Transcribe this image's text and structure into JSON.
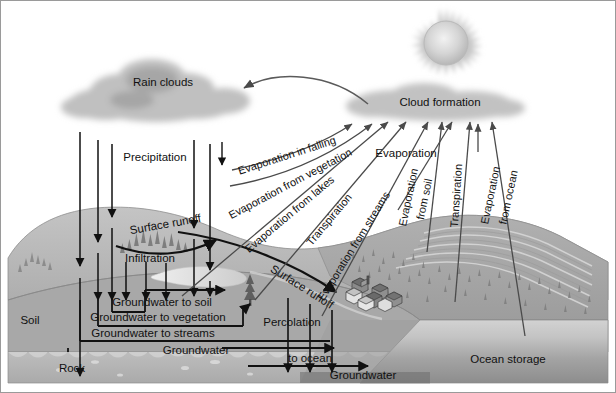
{
  "diagram": {
    "width": 616,
    "height": 393
  },
  "sky": {
    "sun": "sun-icon",
    "rain_clouds_label": "Rain clouds",
    "cloud_formation_label": "Cloud formation"
  },
  "labels": {
    "precipitation": "Precipitation",
    "evaporation_in_falling": "Evaporation in falling",
    "evaporation_from_vegetation": "Evaporation from vegetation",
    "evaporation_from_lakes": "Evaporation from lakes",
    "transpiration_left": "Transpiration",
    "evaporation_from_streams": "Evaporation from streams",
    "evaporation": "Evaporation",
    "evaporation_from_soil_1": "Evaporation",
    "evaporation_from_soil_2": "from soil",
    "transpiration_right": "Transpiration",
    "evaporation_from_ocean_1": "Evaporation",
    "evaporation_from_ocean_2": "from ocean",
    "surface_runoff_upper": "Surface runoff",
    "surface_runoff_lower": "Surface runoff",
    "infiltration": "Infiltration",
    "percolation": "Percolation",
    "groundwater_to_soil": "Groundwater to soil",
    "groundwater_to_vegetation": "Groundwater to vegetation",
    "groundwater_to_streams": "Groundwater to streams",
    "groundwater_mid": "Groundwater",
    "to_ocean": "to ocean",
    "groundwater_bottom": "Groundwater",
    "soil": "Soil",
    "rock": "Rock",
    "ocean_storage": "Ocean storage"
  },
  "colors": {
    "background": "#ffffff",
    "cloud": "#bfbfbf",
    "cloud_dark": "#a9a9a9",
    "sun_body": "#cfcfcf",
    "sun_core": "#ededed",
    "arrow": "#111111",
    "thin_arrow": "#555555",
    "land_light": "#bcbcbc",
    "land_mid": "#a8a8a8",
    "land_dark": "#9a9a9a",
    "rock": "#b2b2b2",
    "ocean_light": "#c8c8c8",
    "ocean_dark": "#8f8f8f",
    "text": "#111111",
    "border": "#8a8a8a"
  }
}
